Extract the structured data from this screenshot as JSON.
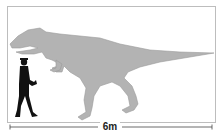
{
  "figure": {
    "scale_label": "6m",
    "colors": {
      "dinosaur_fill": "#b3b3b3",
      "dinosaur_outline": "#9a9a9a",
      "human_fill": "#111111",
      "frame_border": "#bdbdbd",
      "scale_line": "#444444"
    }
  }
}
